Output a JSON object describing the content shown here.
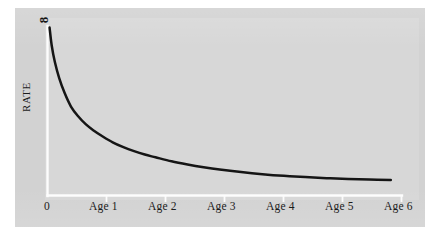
{
  "figure": {
    "background_color": "#ffffff",
    "panel_color": "#d2d2d2",
    "axis_color": "#fdfdfd",
    "curve_color": "#151515"
  },
  "axes": {
    "y_axis_title": "RATE",
    "y_top_label": "8",
    "x_origin_label": "0",
    "x_tick_labels": [
      "0",
      "Age 1",
      "Age 2",
      "Age 3",
      "Age 4",
      "Age 5",
      "Age 6"
    ]
  },
  "chart_data": {
    "type": "line",
    "title": "",
    "subtitle": "",
    "xlabel": "",
    "ylabel": "RATE",
    "grid": false,
    "legend": "none",
    "xlim": [
      0,
      6.6
    ],
    "ylim": [
      0,
      8
    ],
    "x_tick_values": [
      0,
      1,
      2,
      3,
      4,
      5,
      6
    ],
    "x_tick_labels": [
      "0",
      "Age 1",
      "Age 2",
      "Age 3",
      "Age 4",
      "Age 5",
      "Age 6"
    ],
    "y_tick_values": [
      8
    ],
    "y_tick_labels": [
      "8"
    ],
    "annotations": [],
    "series": [
      {
        "name": "rate",
        "x": [
          0.02,
          0.06,
          0.12,
          0.2,
          0.3,
          0.42,
          0.55,
          0.7,
          0.85,
          1.0,
          1.2,
          1.4,
          1.6,
          1.8,
          2.0,
          2.3,
          2.6,
          2.9,
          3.2,
          3.6,
          4.0,
          4.4,
          4.8,
          5.2,
          5.6,
          6.0,
          6.4
        ],
        "y": [
          7.95,
          7.1,
          6.3,
          5.55,
          4.85,
          4.2,
          3.75,
          3.35,
          3.05,
          2.8,
          2.5,
          2.27,
          2.08,
          1.92,
          1.79,
          1.6,
          1.45,
          1.32,
          1.21,
          1.09,
          0.99,
          0.91,
          0.85,
          0.8,
          0.76,
          0.73,
          0.71
        ]
      }
    ]
  }
}
